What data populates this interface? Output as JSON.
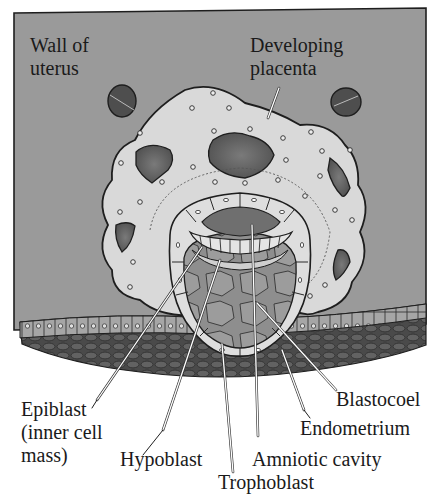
{
  "labels": {
    "wall_of_uterus": [
      "Wall of",
      "uterus"
    ],
    "developing_placenta": [
      "Developing",
      "placenta"
    ],
    "epiblast": [
      "Epiblast",
      "(inner cell",
      "mass)"
    ],
    "hypoblast": "Hypoblast",
    "trophoblast": "Trophoblast",
    "amniotic_cavity": "Amniotic  cavity",
    "endometrium": "Endometrium",
    "blastocoel": "Blastocoel"
  },
  "colors": {
    "uterus_wall": "#9a9a9a",
    "placenta": "#d9d9d9",
    "lacunae": "#5e5e5e",
    "endometrium_epithelium": "#a8a8a8",
    "endometrium_stroma": "#4a4a4a",
    "blastocoel": "#8c8c8c",
    "outline": "#1e1e1e",
    "leader_line": "#ffffff"
  }
}
